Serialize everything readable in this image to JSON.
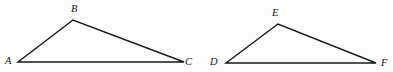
{
  "figure": {
    "caption": "Two similar triangles labeled ABC and DEF",
    "background_color": "#fdfdfd",
    "stroke_color": "#1a1a1a",
    "label_color": "#141414",
    "stroke_width": 1.5,
    "width": 393,
    "height": 72,
    "shapes": [
      {
        "name": "triangle-abc",
        "label": "Triangle ABC",
        "vertices": [
          {
            "name": "A",
            "x": 18,
            "y": 62,
            "label_x": 5,
            "label_y": 64
          },
          {
            "name": "B",
            "x": 73,
            "y": 20,
            "label_x": 71,
            "label_y": 12
          },
          {
            "name": "C",
            "x": 184,
            "y": 62,
            "label_x": 185,
            "label_y": 65
          }
        ],
        "edges": [
          {
            "name": "segment-AB",
            "from": "A",
            "to": "B"
          },
          {
            "name": "segment-BC",
            "from": "B",
            "to": "C"
          },
          {
            "name": "segment-AC",
            "from": "A",
            "to": "C"
          }
        ]
      },
      {
        "name": "triangle-def",
        "label": "Triangle DEF",
        "vertices": [
          {
            "name": "D",
            "x": 226,
            "y": 63,
            "label_x": 210,
            "label_y": 65
          },
          {
            "name": "E",
            "x": 278,
            "y": 24,
            "label_x": 272,
            "label_y": 16
          },
          {
            "name": "F",
            "x": 376,
            "y": 63,
            "label_x": 381,
            "label_y": 66
          }
        ],
        "edges": [
          {
            "name": "segment-DE",
            "from": "D",
            "to": "E"
          },
          {
            "name": "segment-EF",
            "from": "E",
            "to": "F"
          },
          {
            "name": "segment-DF",
            "from": "D",
            "to": "F"
          }
        ]
      }
    ]
  }
}
